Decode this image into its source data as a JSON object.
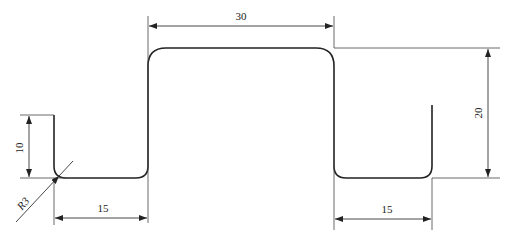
{
  "diagram": {
    "type": "technical-drawing",
    "dimensions": {
      "top_width": "30",
      "height": "20",
      "left_flange_width": "15",
      "right_flange_width": "15",
      "leg_height": "10",
      "bend_radius": "R3"
    },
    "colors": {
      "line": "#222222",
      "background": "#ffffff"
    }
  }
}
